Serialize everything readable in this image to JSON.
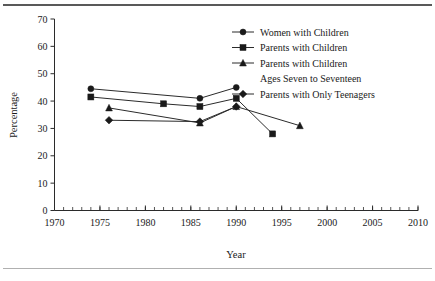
{
  "chart_data": {
    "type": "line",
    "title": "",
    "xlabel": "Year",
    "ylabel": "Percentage",
    "xlim": [
      1970,
      2010
    ],
    "ylim": [
      0,
      70
    ],
    "xticks": [
      1970,
      1975,
      1980,
      1985,
      1990,
      1995,
      2000,
      2005,
      2010
    ],
    "xtick_labels": [
      "1970",
      "1975",
      "1980",
      "1985",
      "1990",
      "1995",
      "2000",
      "2005",
      "2010"
    ],
    "yticks": [
      0,
      10,
      20,
      30,
      40,
      50,
      60,
      70
    ],
    "ytick_labels": [
      "0",
      "10",
      "20",
      "30",
      "40",
      "50",
      "60",
      "70"
    ],
    "minor_xtick_step": 1,
    "grid": false,
    "legend_position": "top-right",
    "series": [
      {
        "name": "Women with Children",
        "marker": "circle",
        "x": [
          1974,
          1986,
          1990
        ],
        "values": [
          44.5,
          41.0,
          45.0
        ]
      },
      {
        "name": "Parents with Children",
        "marker": "square",
        "x": [
          1974,
          1982,
          1986,
          1990,
          1994
        ],
        "values": [
          41.5,
          39.0,
          38.0,
          41.0,
          28.0
        ]
      },
      {
        "name": "Parents with Children Ages Seven to Seventeen",
        "marker": "triangle",
        "x": [
          1976,
          1986,
          1990,
          1997
        ],
        "values": [
          37.5,
          32.0,
          38.0,
          31.0
        ]
      },
      {
        "name": "Parents with Only Teenagers",
        "marker": "diamond",
        "x": [
          1976,
          1986,
          1990
        ],
        "values": [
          33.0,
          32.5,
          38.0
        ]
      }
    ]
  },
  "legend": {
    "items": [
      {
        "label": "Women with Children",
        "marker": "circle"
      },
      {
        "label": "Parents with Children",
        "marker": "square"
      },
      {
        "label": "Parents with Children",
        "label2": "Ages Seven to Seventeen",
        "marker": "triangle"
      },
      {
        "label": "Parents with Only Teenagers",
        "marker": "diamond"
      }
    ]
  },
  "colors": {
    "ink": "#1a1a1a",
    "axis": "#2b2b2b",
    "rule_top": "#595959",
    "rule_bottom": "#b0b0b0",
    "background": "#ffffff"
  }
}
